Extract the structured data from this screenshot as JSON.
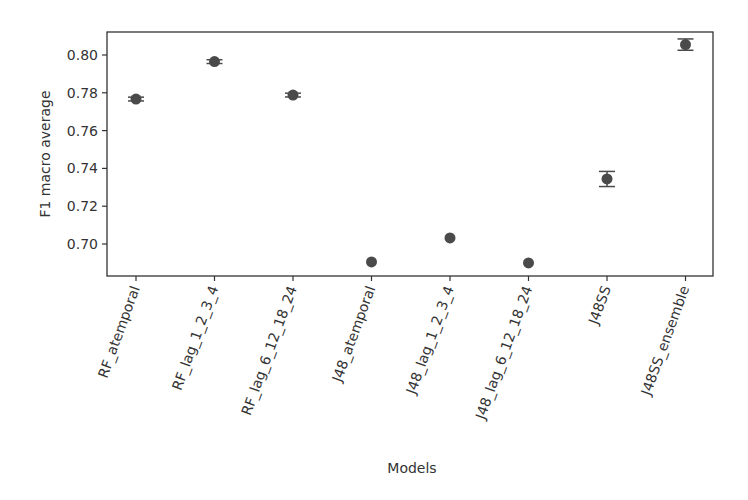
{
  "chart_data": {
    "type": "scatter",
    "title": "",
    "xlabel": "Models",
    "ylabel": "F1 macro average",
    "categories": [
      "RF_atemporal",
      "RF_lag_1_2_3_4",
      "RF_lag_6_12_18_24",
      "J48_atemporal",
      "J48_lag_1_2_3_4",
      "J48_lag_6_12_18_24",
      "J48SS",
      "J48SS_ensemble"
    ],
    "values": [
      0.7767,
      0.7965,
      0.7788,
      0.6905,
      0.7032,
      0.69,
      0.7344,
      0.8055
    ],
    "errors": [
      0.001,
      0.001,
      0.001,
      0.0,
      0.0,
      0.0,
      0.004,
      0.003
    ],
    "yticks": [
      0.7,
      0.72,
      0.74,
      0.76,
      0.78,
      0.8
    ],
    "ytick_labels": [
      "0.70",
      "0.72",
      "0.74",
      "0.76",
      "0.78",
      "0.80"
    ],
    "ylim": [
      0.682,
      0.812
    ],
    "grid": false,
    "legend": null,
    "marker_color": "#4a4a4a",
    "xtick_rotation": 70
  }
}
